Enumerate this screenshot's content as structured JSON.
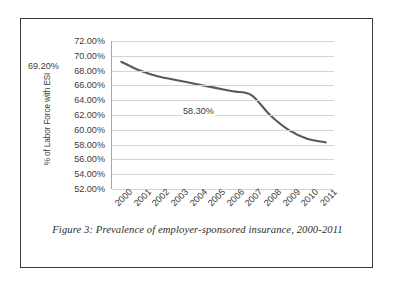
{
  "figure": {
    "caption": "Figure 3: Prevalence of employer-sponsored insurance, 2000-2011"
  },
  "colors": {
    "line": "#595959",
    "gridline": "#d4d4d4",
    "axis": "#a6a6a6",
    "text": "#3b3b3b",
    "frame": "#3a3a3a",
    "background": "#ffffff"
  },
  "chart_data": {
    "type": "line",
    "title": "",
    "xlabel": "",
    "ylabel": "% of Labor Force with ESI",
    "categories": [
      "2000",
      "2001",
      "2002",
      "2003",
      "2004",
      "2005",
      "2006",
      "2007",
      "2008",
      "2009",
      "2010",
      "2011"
    ],
    "values": [
      69.2,
      68.0,
      67.2,
      66.7,
      66.2,
      65.7,
      65.2,
      64.7,
      62.0,
      60.0,
      58.8,
      58.3
    ],
    "series": [
      {
        "name": "% of Labor Force with ESI",
        "values": [
          69.2,
          68.0,
          67.2,
          66.7,
          66.2,
          65.7,
          65.2,
          64.7,
          62.0,
          60.0,
          58.8,
          58.3
        ]
      }
    ],
    "ylim": [
      52,
      72
    ],
    "ytick_values": [
      72,
      70,
      68,
      66,
      64,
      62,
      60,
      58,
      56,
      54,
      52
    ],
    "ytick_labels": [
      "72.00%",
      "70.00%",
      "68.00%",
      "66.00%",
      "64.00%",
      "62.00%",
      "60.00%",
      "58.00%",
      "56.00%",
      "54.00%",
      "52.00%"
    ],
    "grid": true,
    "legend": "none",
    "xtick_rotation": -45,
    "annotations": [
      {
        "text": "69.20%",
        "point": "2000",
        "value": 69.2
      },
      {
        "text": "58.30%",
        "point": "2011",
        "value": 58.3
      }
    ]
  }
}
